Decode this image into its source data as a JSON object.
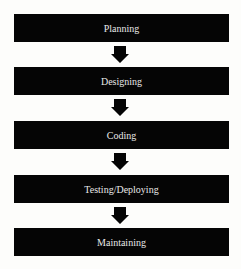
{
  "diagram": {
    "type": "flowchart",
    "direction": "top-to-bottom",
    "steps": [
      {
        "label": "Planning"
      },
      {
        "label": "Designing"
      },
      {
        "label": "Coding"
      },
      {
        "label": "Testing/Deploying"
      },
      {
        "label": "Maintaining"
      }
    ],
    "connector_icon": "down-arrow-icon",
    "colors": {
      "box_fill": "#050505",
      "box_text": "#e8e8e8",
      "arrow": "#050505",
      "background": "#fdfdfb"
    }
  }
}
